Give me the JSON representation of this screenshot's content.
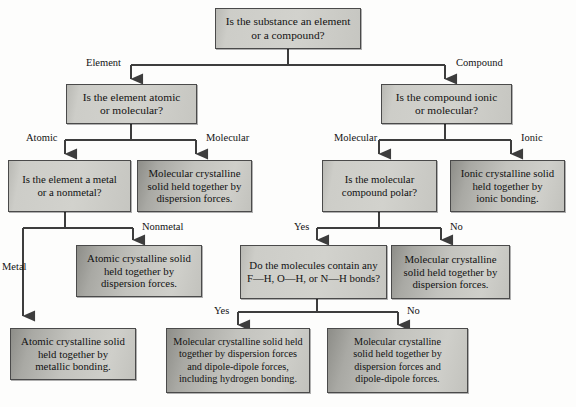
{
  "diagram": {
    "colors": {
      "box_border": "#4a4a4a",
      "box_fill_question": "#d0d0cb",
      "box_fill_result": "#bdbdb8",
      "wire": "#3d3d3d",
      "text": "#121212",
      "page_background": "#fdfdfc"
    },
    "nodes": [
      {
        "id": "root",
        "kind": "question",
        "lines": [
          "Is the substance an element",
          "or a compound?"
        ]
      },
      {
        "id": "element_q",
        "kind": "question",
        "lines": [
          "Is the element atomic",
          "or molecular?"
        ]
      },
      {
        "id": "compound_q",
        "kind": "question",
        "lines": [
          "Is the compound ionic",
          "or molecular?"
        ]
      },
      {
        "id": "metal_q",
        "kind": "question",
        "lines": [
          "Is the element a metal",
          "or a nonmetal?"
        ]
      },
      {
        "id": "molecular_elem",
        "kind": "result",
        "lines": [
          "Molecular crystalline",
          "solid held together by",
          "dispersion forces."
        ]
      },
      {
        "id": "polar_q",
        "kind": "question",
        "lines": [
          "Is the molecular",
          "compound polar?"
        ]
      },
      {
        "id": "ionic_solid",
        "kind": "result",
        "lines": [
          "Ionic crystalline solid",
          "held together by",
          "ionic bonding."
        ]
      },
      {
        "id": "atomic_disp",
        "kind": "result",
        "lines": [
          "Atomic crystalline solid",
          "held together by",
          "dispersion forces."
        ]
      },
      {
        "id": "hbond_q",
        "kind": "question",
        "lines": [
          "Do the molecules contain any",
          "F—H, O—H, or N—H bonds?"
        ]
      },
      {
        "id": "nonpolar_mol",
        "kind": "result",
        "lines": [
          "Molecular crystalline",
          "solid held together by",
          "dispersion forces."
        ]
      },
      {
        "id": "metallic_solid",
        "kind": "result",
        "lines": [
          "Atomic crystalline solid",
          "held together by",
          "metallic bonding."
        ]
      },
      {
        "id": "hbond_solid",
        "kind": "result",
        "lines": [
          "Molecular crystalline solid held",
          "together by dispersion forces",
          "and dipole-dipole forces,",
          "including hydrogen bonding."
        ]
      },
      {
        "id": "dipole_solid",
        "kind": "result",
        "lines": [
          "Molecular crystalline",
          "solid held together by",
          "dispersion forces and",
          "dipole-dipole forces."
        ]
      }
    ],
    "edge_labels": [
      {
        "id": "element",
        "text": "Element"
      },
      {
        "id": "compound",
        "text": "Compound"
      },
      {
        "id": "atomic",
        "text": "Atomic"
      },
      {
        "id": "molecular_l",
        "text": "Molecular"
      },
      {
        "id": "molecular_r",
        "text": "Molecular"
      },
      {
        "id": "ionic",
        "text": "Ionic"
      },
      {
        "id": "metal",
        "text": "Metal"
      },
      {
        "id": "nonmetal",
        "text": "Nonmetal"
      },
      {
        "id": "polar_yes",
        "text": "Yes"
      },
      {
        "id": "polar_no",
        "text": "No"
      },
      {
        "id": "hbond_yes",
        "text": "Yes"
      },
      {
        "id": "hbond_no",
        "text": "No"
      }
    ]
  }
}
